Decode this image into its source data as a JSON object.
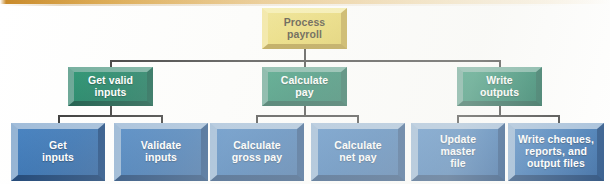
{
  "diagram": {
    "type": "structure-chart",
    "colors": {
      "root_fill": "#e8d45c",
      "level2_fill": "#0f7a5a",
      "level3_fill": "#2f6cae",
      "connector": "#2b2b2b",
      "top_rule": "#d9a13f"
    },
    "root": {
      "id": "process-payroll",
      "label": "Process\npayroll",
      "level": 1
    },
    "level2": [
      {
        "id": "get-valid-inputs",
        "label": "Get valid\ninputs",
        "level": 2
      },
      {
        "id": "calculate-pay",
        "label": "Calculate\npay",
        "level": 2
      },
      {
        "id": "write-outputs",
        "label": "Write\noutputs",
        "level": 2
      }
    ],
    "level3": [
      {
        "id": "get-inputs",
        "label": "Get\ninputs",
        "parent": "get-valid-inputs",
        "level": 3
      },
      {
        "id": "validate-inputs",
        "label": "Validate\ninputs",
        "parent": "get-valid-inputs",
        "level": 3
      },
      {
        "id": "calculate-gross-pay",
        "label": "Calculate\ngross pay",
        "parent": "calculate-pay",
        "level": 3
      },
      {
        "id": "calculate-net-pay",
        "label": "Calculate\nnet pay",
        "parent": "calculate-pay",
        "level": 3
      },
      {
        "id": "update-master-file",
        "label": "Update\nmaster\nfile",
        "parent": "write-outputs",
        "level": 3
      },
      {
        "id": "write-cheques-reports",
        "label": "Write cheques,\nreports, and\noutput files",
        "parent": "write-outputs",
        "level": 3
      }
    ]
  }
}
